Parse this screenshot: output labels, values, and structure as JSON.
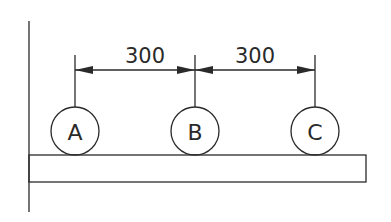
{
  "diagram": {
    "dimensions": [
      {
        "label": "300",
        "from": "A",
        "to": "B"
      },
      {
        "label": "300",
        "from": "B",
        "to": "C"
      }
    ],
    "nodes": [
      {
        "label": "A"
      },
      {
        "label": "B"
      },
      {
        "label": "C"
      }
    ],
    "colors": {
      "line": "#2a2a2a",
      "background": "#ffffff"
    }
  }
}
